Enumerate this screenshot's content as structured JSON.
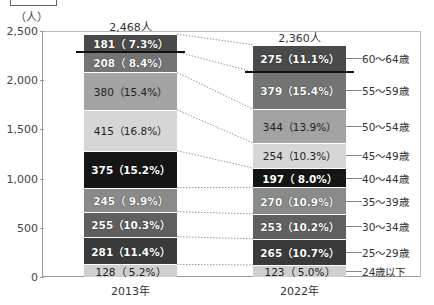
{
  "chart_data": {
    "type": "bar",
    "stacked": true,
    "title": "",
    "xlabel": "",
    "ylabel": "（人）",
    "ylim": [
      0,
      2500
    ],
    "yticks": [
      "0",
      "500",
      "1,000",
      "1,500",
      "2,000",
      "2,500"
    ],
    "categories": [
      "2013年",
      "2022年"
    ],
    "totals": [
      "2,468人",
      "2,360人"
    ],
    "series": [
      {
        "name": "24歳以下",
        "values": [
          128,
          123
        ],
        "labels": [
          "128（ 5.2%）",
          "123（ 5.0%）"
        ],
        "color": "#cfcfcf"
      },
      {
        "name": "25～29歳",
        "values": [
          281,
          265
        ],
        "labels": [
          "281（11.4%）",
          "265（10.7%）"
        ],
        "color": "#3a3a3a"
      },
      {
        "name": "30～34歳",
        "values": [
          255,
          253
        ],
        "labels": [
          "255（10.3%）",
          "253（10.2%）"
        ],
        "color": "#5f5f5f"
      },
      {
        "name": "35～39歳",
        "values": [
          245,
          270
        ],
        "labels": [
          "245（ 9.9%）",
          "270（10.9%）"
        ],
        "color": "#8a8a8a"
      },
      {
        "name": "40～44歳",
        "values": [
          375,
          197
        ],
        "labels": [
          "375（15.2%）",
          "197（ 8.0%）"
        ],
        "color": "#151515"
      },
      {
        "name": "45～49歳",
        "values": [
          415,
          254
        ],
        "labels": [
          "415（16.8%）",
          "254（10.3%）"
        ],
        "color": "#d6d6d6"
      },
      {
        "name": "50～54歳",
        "values": [
          380,
          344
        ],
        "labels": [
          "380（15.4%）",
          "344（13.9%）"
        ],
        "color": "#a3a3a3"
      },
      {
        "name": "55～59歳",
        "values": [
          208,
          379
        ],
        "labels": [
          "208（ 8.4%）",
          "379（15.4%）"
        ],
        "color": "#747474"
      },
      {
        "name": "60～64歳",
        "values": [
          181,
          275
        ],
        "labels": [
          "181（ 7.3%）",
          "275（11.1%）"
        ],
        "color": "#4a4a4a"
      }
    ],
    "legend_position": "right",
    "grid": false
  },
  "unit_label": "（人）"
}
